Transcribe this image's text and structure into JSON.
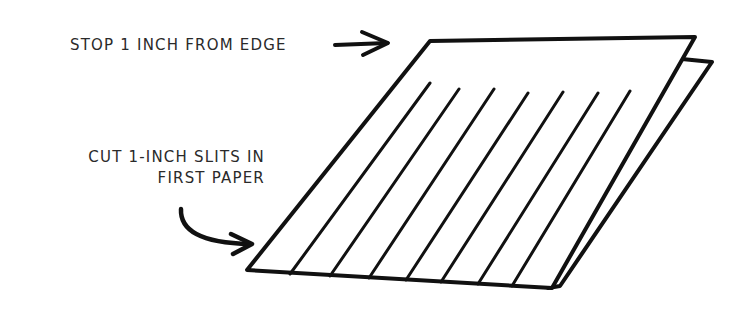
{
  "labels": {
    "stop": "STOP 1 INCH FROM EDGE",
    "cut_line1": "CUT 1-INCH SLITS IN",
    "cut_line2": "FIRST PAPER"
  },
  "colors": {
    "ink": "#111111",
    "text": "#2a2a2a",
    "background": "#ffffff"
  },
  "diagram": {
    "first_paper": {
      "points": "430,41 695,37 552,288 247,270"
    },
    "second_paper_edge": {
      "points": "682,59 712,62 560,286"
    },
    "slits": [
      {
        "x1": 430,
        "y1": 83,
        "x2": 290,
        "y2": 274
      },
      {
        "x1": 459,
        "y1": 89,
        "x2": 330,
        "y2": 276
      },
      {
        "x1": 494,
        "y1": 89,
        "x2": 369,
        "y2": 278
      },
      {
        "x1": 528,
        "y1": 93,
        "x2": 406,
        "y2": 280
      },
      {
        "x1": 563,
        "y1": 92,
        "x2": 441,
        "y2": 282
      },
      {
        "x1": 598,
        "y1": 93,
        "x2": 478,
        "y2": 284
      },
      {
        "x1": 630,
        "y1": 91,
        "x2": 512,
        "y2": 286
      }
    ]
  }
}
